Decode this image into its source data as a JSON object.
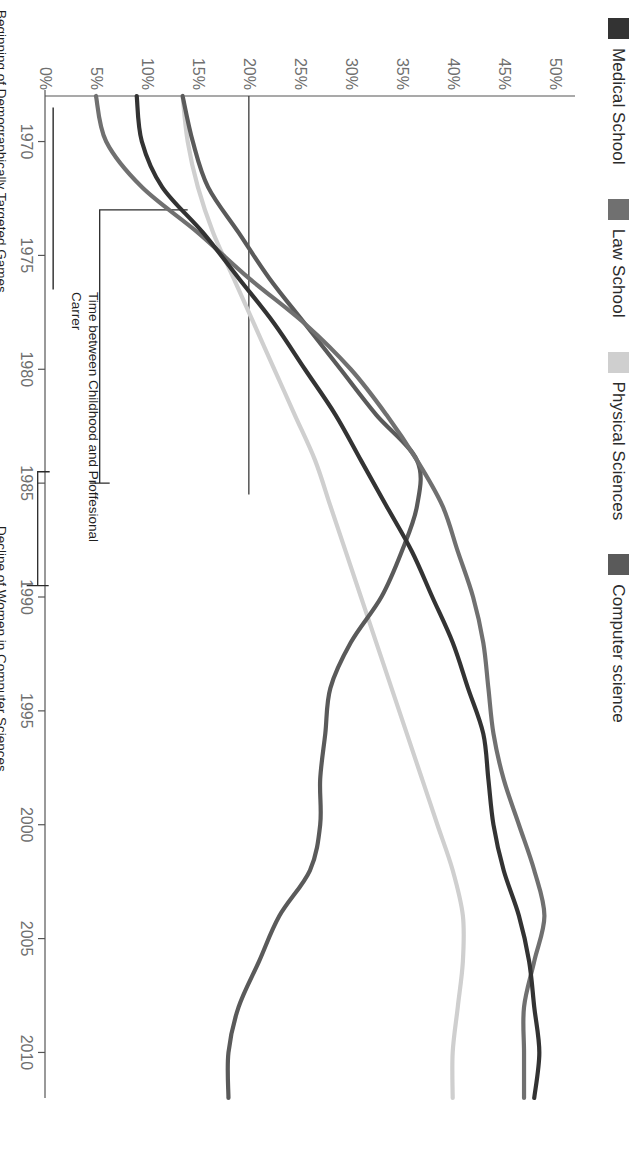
{
  "legend": {
    "items": [
      {
        "label": "Medical School",
        "color": "#333333",
        "swatch_name": "legend-swatch-medical-school"
      },
      {
        "label": "Law School",
        "color": "#707070",
        "swatch_name": "legend-swatch-law-school"
      },
      {
        "label": "Physical Sciences",
        "color": "#cfcfcf",
        "swatch_name": "legend-swatch-physical-sciences"
      },
      {
        "label": "Computer science",
        "color": "#5a5a5a",
        "swatch_name": "legend-swatch-computer-science"
      }
    ]
  },
  "annotations": {
    "games": "Beginning of Demographically Targeted Games",
    "childhood": "Time between Childhood and Proffesional\nCarrer",
    "decline": "Decline of Women in Computer Sciences"
  },
  "chart_data": {
    "type": "line",
    "title": "",
    "subtitle": "",
    "xlabel": "",
    "ylabel": "",
    "xlim": [
      1968,
      2012
    ],
    "ylim": [
      0,
      52
    ],
    "grid": false,
    "legend_position": "top-left",
    "y_ticks": [
      "0%",
      "5%",
      "10%",
      "15%",
      "20%",
      "25%",
      "30%",
      "35%",
      "40%",
      "45%",
      "50%"
    ],
    "y_tick_values": [
      0,
      5,
      10,
      15,
      20,
      25,
      30,
      35,
      40,
      45,
      50
    ],
    "x_ticks": [
      "1970",
      "1975",
      "1980",
      "1985",
      "1990",
      "1995",
      "2000",
      "2005",
      "2010"
    ],
    "x_tick_values": [
      1970,
      1975,
      1980,
      1985,
      1990,
      1995,
      2000,
      2005,
      2010
    ],
    "x": [
      1968,
      1970,
      1972,
      1974,
      1976,
      1978,
      1980,
      1982,
      1984,
      1986,
      1988,
      1990,
      1992,
      1994,
      1996,
      1998,
      2000,
      2002,
      2004,
      2006,
      2008,
      2010,
      2012
    ],
    "series": [
      {
        "name": "Medical School",
        "color": "#333333",
        "values": [
          9.0,
          9.5,
          11.5,
          15.5,
          19.0,
          22.5,
          25.5,
          28.5,
          31.0,
          33.5,
          36.0,
          38.0,
          40.0,
          41.5,
          43.0,
          43.5,
          44.0,
          45.0,
          46.5,
          47.5,
          48.0,
          48.5,
          48.0
        ]
      },
      {
        "name": "Law School",
        "color": "#707070",
        "values": [
          5.0,
          6.0,
          9.5,
          15.0,
          20.0,
          25.5,
          30.0,
          33.5,
          36.5,
          39.0,
          40.5,
          42.0,
          43.0,
          43.5,
          44.0,
          45.0,
          46.5,
          48.0,
          49.0,
          48.0,
          47.0,
          47.0,
          47.0
        ]
      },
      {
        "name": "Physical Sciences",
        "color": "#cfcfcf",
        "values": [
          13.5,
          14.0,
          15.0,
          16.5,
          18.5,
          20.5,
          22.5,
          24.5,
          26.5,
          28.0,
          29.5,
          31.0,
          32.5,
          34.0,
          35.5,
          37.0,
          38.5,
          40.0,
          41.0,
          41.0,
          40.5,
          40.0,
          40.0
        ]
      },
      {
        "name": "Computer science",
        "color": "#5a5a5a",
        "values": [
          13.5,
          14.5,
          16.0,
          19.0,
          22.0,
          25.5,
          29.0,
          32.5,
          36.5,
          36.5,
          35.0,
          33.0,
          30.0,
          28.0,
          27.5,
          27.0,
          27.0,
          26.0,
          23.0,
          21.0,
          19.0,
          18.0,
          18.0
        ]
      }
    ],
    "marker_lines": [
      {
        "name": "games",
        "x_start": 1968.5,
        "x_end": 1976.5,
        "y": 0.8,
        "label": "Beginning of Demographically Targeted Games"
      },
      {
        "name": "childhood",
        "x_start": 1973.0,
        "x_end": 1985.0,
        "y_level": 14.0,
        "label": "Time between Childhood and Proffesional Carrer"
      },
      {
        "name": "decline",
        "x_start": 1984.5,
        "x_end": 1989.5,
        "y": 14.0,
        "label": "Decline of Women in Computer Sciences"
      }
    ],
    "reference_line": {
      "name": "horizontal-reference-1973",
      "y": 20.0,
      "x_start": 1968.0,
      "x_end": 1985.5
    }
  }
}
